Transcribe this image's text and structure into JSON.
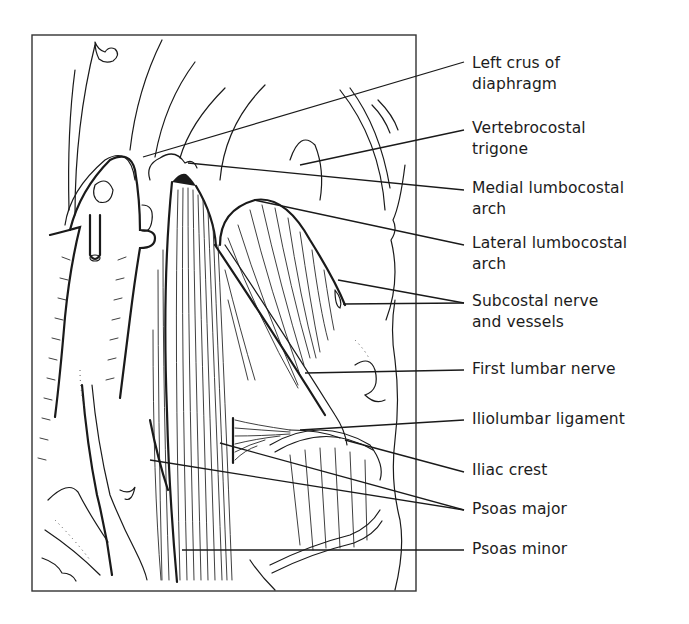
{
  "figure": {
    "colors": {
      "ink": "#1a1a1a",
      "background": "#ffffff"
    }
  },
  "labels": [
    {
      "id": "left-crus",
      "lines": [
        "Left crus of",
        "diaphragm"
      ],
      "top": 53,
      "leader_end": [
        464,
        62
      ],
      "targets": [
        [
          143,
          157
        ]
      ]
    },
    {
      "id": "vertebrocostal-trigone",
      "lines": [
        "Vertebrocostal",
        "trigone"
      ],
      "top": 118,
      "leader_end": [
        464,
        130
      ],
      "targets": [
        [
          300,
          165
        ]
      ]
    },
    {
      "id": "medial-lumbocostal-arch",
      "lines": [
        "Medial lumbocostal",
        "arch"
      ],
      "top": 178,
      "leader_end": [
        464,
        190
      ],
      "targets": [
        [
          188,
          163
        ]
      ]
    },
    {
      "id": "lateral-lumbocostal-arch",
      "lines": [
        "Lateral lumbocostal",
        "arch"
      ],
      "top": 233,
      "leader_end": [
        464,
        245
      ],
      "targets": [
        [
          254,
          200
        ]
      ]
    },
    {
      "id": "subcostal-nerve-vessels",
      "lines": [
        "Subcostal nerve",
        "and vessels"
      ],
      "top": 291,
      "leader_end": [
        464,
        303
      ],
      "targets": [
        [
          338,
          280
        ],
        [
          343,
          304
        ]
      ]
    },
    {
      "id": "first-lumbar-nerve",
      "lines": [
        "First lumbar nerve"
      ],
      "top": 359,
      "leader_end": [
        464,
        370
      ],
      "targets": [
        [
          305,
          373
        ]
      ]
    },
    {
      "id": "iliolumbar-ligament",
      "lines": [
        "Iliolumbar ligament"
      ],
      "top": 409,
      "leader_end": [
        464,
        420
      ],
      "targets": [
        [
          300,
          430
        ]
      ]
    },
    {
      "id": "iliac-crest",
      "lines": [
        "Iliac crest"
      ],
      "top": 460,
      "leader_end": [
        464,
        472
      ],
      "targets": [
        [
          345,
          440
        ]
      ]
    },
    {
      "id": "psoas-major",
      "lines": [
        "Psoas major"
      ],
      "top": 499,
      "leader_end": [
        464,
        510
      ],
      "targets": [
        [
          150,
          460
        ],
        [
          220,
          443
        ]
      ]
    },
    {
      "id": "psoas-minor",
      "lines": [
        "Psoas minor"
      ],
      "top": 539,
      "leader_end": [
        464,
        550
      ],
      "targets": [
        [
          182,
          550
        ]
      ]
    }
  ]
}
